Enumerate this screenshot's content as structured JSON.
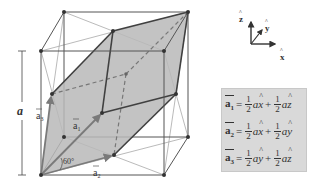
{
  "diagram": {
    "edge_label": "a",
    "angle_label": "60°",
    "vectors": [
      {
        "name": "a1",
        "label": "a",
        "subscript": "1"
      },
      {
        "name": "a2",
        "label": "a",
        "subscript": "2"
      },
      {
        "name": "a3",
        "label": "a",
        "subscript": "3"
      }
    ],
    "colors": {
      "cell_fill": "#b8b8b8",
      "cube_edge": "#555555",
      "face_diagonal": "#999999",
      "cell_edge": "#404040",
      "vector_arrow": "#7a7a7a",
      "formula_bg": "#d9d9d9"
    }
  },
  "axes": {
    "z": "z",
    "y": "y",
    "x": "x"
  },
  "formulas": [
    {
      "lhs": "a",
      "sub": "1",
      "eq": "=",
      "c1_num": "1",
      "c1_den": "2",
      "t1": "a",
      "u1": "x",
      "plus": "+",
      "c2_num": "1",
      "c2_den": "2",
      "t2": "a",
      "u2": "z"
    },
    {
      "lhs": "a",
      "sub": "2",
      "eq": "=",
      "c1_num": "1",
      "c1_den": "2",
      "t1": "a",
      "u1": "x",
      "plus": "+",
      "c2_num": "1",
      "c2_den": "2",
      "t2": "a",
      "u2": "y"
    },
    {
      "lhs": "a",
      "sub": "3",
      "eq": "=",
      "c1_num": "1",
      "c1_den": "2",
      "t1": "a",
      "u1": "y",
      "plus": "+",
      "c2_num": "1",
      "c2_den": "2",
      "t2": "a",
      "u2": "z"
    }
  ]
}
